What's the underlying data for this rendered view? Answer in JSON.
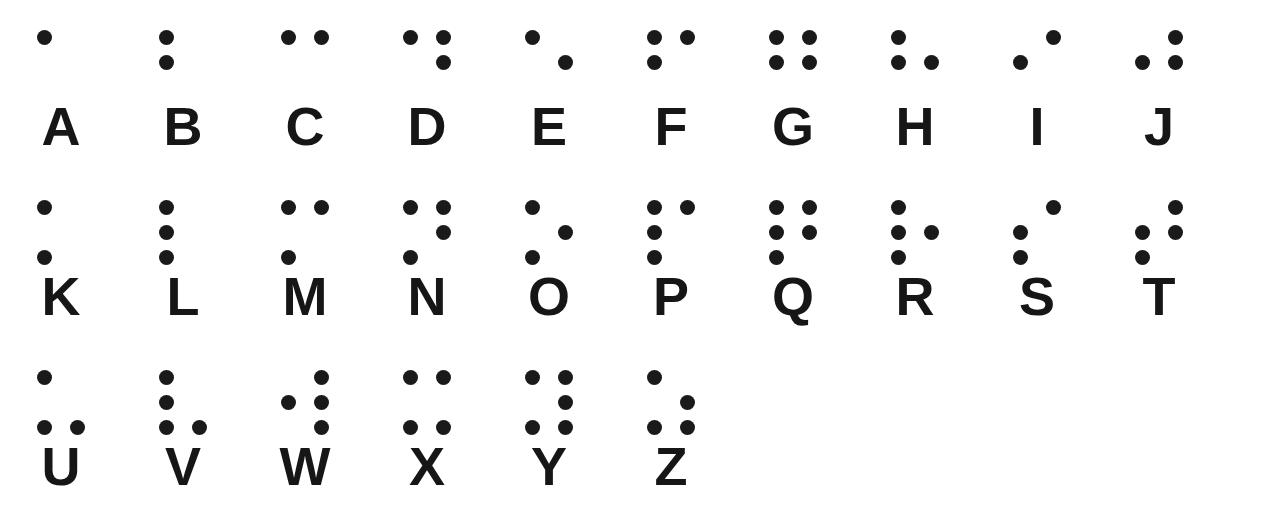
{
  "page": {
    "background_color": "#ffffff",
    "dot_color": "#1a1a1a",
    "letter_color": "#161616"
  },
  "chart_data": {
    "type": "table",
    "dot_positions": {
      "1": "top-left",
      "2": "middle-left",
      "3": "bottom-left",
      "4": "top-right",
      "5": "middle-right",
      "6": "bottom-right"
    },
    "columns_per_row": 10,
    "rows": [
      {
        "row_index": 1,
        "cells": [
          {
            "letter": "A",
            "dots": [
              1
            ]
          },
          {
            "letter": "B",
            "dots": [
              1,
              2
            ]
          },
          {
            "letter": "C",
            "dots": [
              1,
              4
            ]
          },
          {
            "letter": "D",
            "dots": [
              1,
              4,
              5
            ]
          },
          {
            "letter": "E",
            "dots": [
              1,
              5
            ]
          },
          {
            "letter": "F",
            "dots": [
              1,
              2,
              4
            ]
          },
          {
            "letter": "G",
            "dots": [
              1,
              2,
              4,
              5
            ]
          },
          {
            "letter": "H",
            "dots": [
              1,
              2,
              5
            ]
          },
          {
            "letter": "I",
            "dots": [
              2,
              4
            ]
          },
          {
            "letter": "J",
            "dots": [
              2,
              4,
              5
            ]
          }
        ]
      },
      {
        "row_index": 2,
        "cells": [
          {
            "letter": "K",
            "dots": [
              1,
              3
            ]
          },
          {
            "letter": "L",
            "dots": [
              1,
              2,
              3
            ]
          },
          {
            "letter": "M",
            "dots": [
              1,
              3,
              4
            ]
          },
          {
            "letter": "N",
            "dots": [
              1,
              3,
              4,
              5
            ]
          },
          {
            "letter": "O",
            "dots": [
              1,
              3,
              5
            ]
          },
          {
            "letter": "P",
            "dots": [
              1,
              2,
              3,
              4
            ]
          },
          {
            "letter": "Q",
            "dots": [
              1,
              2,
              3,
              4,
              5
            ]
          },
          {
            "letter": "R",
            "dots": [
              1,
              2,
              3,
              5
            ]
          },
          {
            "letter": "S",
            "dots": [
              2,
              3,
              4
            ]
          },
          {
            "letter": "T",
            "dots": [
              2,
              3,
              4,
              5
            ]
          }
        ]
      },
      {
        "row_index": 3,
        "cells": [
          {
            "letter": "U",
            "dots": [
              1,
              3,
              6
            ]
          },
          {
            "letter": "V",
            "dots": [
              1,
              2,
              3,
              6
            ]
          },
          {
            "letter": "W",
            "dots": [
              2,
              4,
              5,
              6
            ]
          },
          {
            "letter": "X",
            "dots": [
              1,
              3,
              4,
              6
            ]
          },
          {
            "letter": "Y",
            "dots": [
              1,
              3,
              4,
              5,
              6
            ]
          },
          {
            "letter": "Z",
            "dots": [
              1,
              3,
              5,
              6
            ]
          }
        ]
      }
    ]
  }
}
